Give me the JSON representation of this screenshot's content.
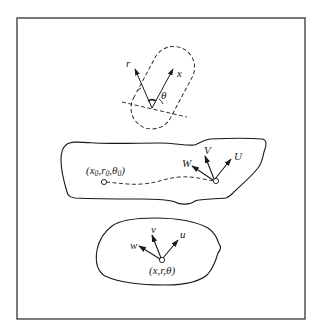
{
  "figure": {
    "frame": {
      "x": 17,
      "y": 18,
      "width": 288,
      "height": 301
    },
    "colors": {
      "stroke": "#1a1a1a",
      "background": "#ffffff",
      "frame": "#333333"
    },
    "probe": {
      "label_r": "r",
      "label_x": "x",
      "label_theta": "θ",
      "description": "dashed capsule sensor with r and x axes at angle θ"
    },
    "region_upper": {
      "start_label": "(x₀,r₀,θ₀)",
      "start_label_parts": {
        "x": "x",
        "x_sub": "0",
        "r": "r",
        "r_sub": "0",
        "theta": "θ",
        "theta_sub": "0"
      },
      "vectors": [
        "W",
        "V",
        "U"
      ],
      "path": "dashed trajectory from start point to moving point"
    },
    "region_lower": {
      "point_label": "(x,r,θ)",
      "vectors": [
        "w",
        "v",
        "u"
      ]
    }
  }
}
